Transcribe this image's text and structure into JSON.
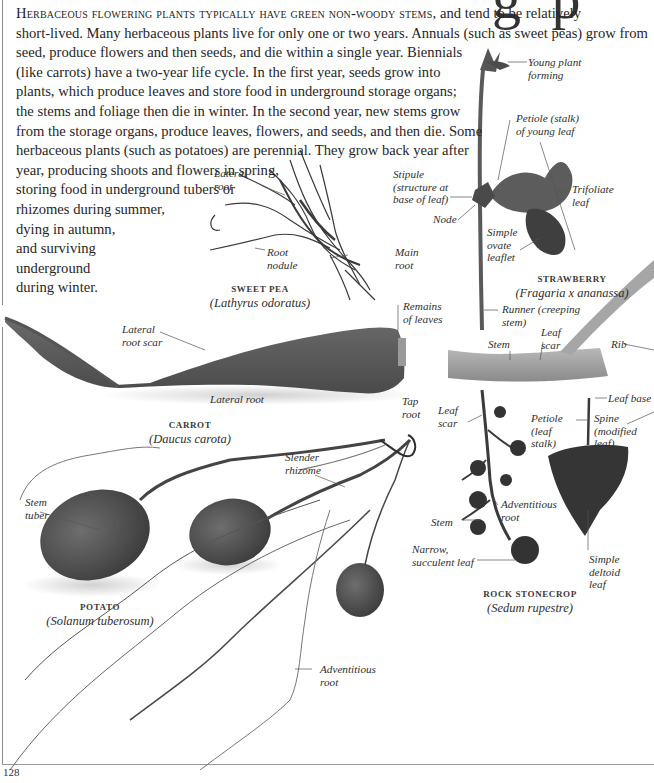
{
  "page": {
    "title_fragment": "g p",
    "page_number": "128"
  },
  "intro": {
    "lead_smallcaps": "Herbaceous flowering plants typically have green non-woody stems,",
    "lines": [
      " and tend to be relatively",
      "short-lived. Many herbaceous plants live for only one or two years. Annuals (such as sweet peas) grow from",
      "seed, produce flowers and then seeds, and die within a single year. Biennials",
      "(like carrots) have a two-year life cycle. In the first year, seeds grow into",
      "plants, which produce leaves and store food in underground storage organs;",
      "the stems and foliage then die in winter. In the second year, new stems grow",
      "from the storage organs, produce leaves, flowers, and seeds, and then die. Some",
      "herbaceous plants (such as potatoes) are perennial. They grow back year after",
      "year, producing shoots and flowers in spring,",
      "storing food in underground tubers or",
      "rhizomes during summer,",
      "dying in autumn,",
      "and surviving",
      "underground",
      "during winter."
    ]
  },
  "specimens": {
    "sweet_pea": {
      "common_name": "SWEET PEA",
      "scientific_name": "(Lathyrus odoratus)",
      "labels": {
        "lateral_root": "Lateral\nroot",
        "root_nodule": "Root\nnodule",
        "main_root": "Main\nroot"
      }
    },
    "strawberry": {
      "common_name": "STRAWBERRY",
      "scientific_name": "(Fragaria x ananassa)",
      "labels": {
        "young_plant": "Young plant\nforming",
        "petiole": "Petiole (stalk)\nof young leaf",
        "stipule": "Stipule\n(structure at\nbase of leaf)",
        "trifoliate": "Trifoliate\nleaf",
        "node": "Node",
        "simple_ovate": "Simple\novate\nleaflet",
        "runner": "Runner (creeping\nstem)"
      }
    },
    "carrot": {
      "common_name": "CARROT",
      "scientific_name": "(Daucus carota)",
      "labels": {
        "lateral_root_scar": "Lateral\nroot scar",
        "remains_of_leaves": "Remains\nof leaves",
        "lateral_root": "Lateral root",
        "tap_root": "Tap\nroot"
      }
    },
    "stem_piece": {
      "labels": {
        "stem": "Stem",
        "leaf_scar": "Leaf\nscar",
        "rib": "Rib"
      }
    },
    "rock_stonecrop": {
      "common_name": "ROCK STONECROP",
      "scientific_name": "(Sedum rupestre)",
      "labels": {
        "leaf_scar": "Leaf\nscar",
        "adventitious_root": "Adventitious\nroot",
        "stem": "Stem",
        "narrow_leaf": "Narrow,\nsucculent leaf"
      }
    },
    "deltoid_leaf": {
      "labels": {
        "leaf_base": "Leaf base",
        "petiole": "Petiole\n(leaf\nstalk)",
        "spine": "Spine\n(modified\nleaf)",
        "simple_deltoid": "Simple\ndeltoid\nleaf"
      }
    },
    "potato": {
      "common_name": "POTATO",
      "scientific_name": "(Solanum tuberosum)",
      "labels": {
        "slender_rhizome": "Slender\nrhizome",
        "stem_tuber": "Stem\ntuber",
        "adventitious_root": "Adventitious\nroot"
      }
    }
  }
}
